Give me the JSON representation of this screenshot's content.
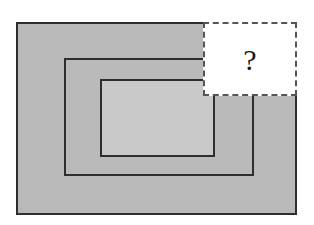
{
  "diagram": {
    "shapes": [
      {
        "name": "outer-rectangle",
        "fill": "#b9b9b9",
        "stroke": "#2e2e2e"
      },
      {
        "name": "middle-rectangle",
        "fill": "#bababa",
        "stroke": "#2e2e2e"
      },
      {
        "name": "inner-rectangle",
        "fill": "#c9c9c9",
        "stroke": "#2e2e2e"
      }
    ],
    "mystery_box": {
      "label": "?",
      "border_style": "dashed",
      "fill": "#ffffff"
    }
  }
}
